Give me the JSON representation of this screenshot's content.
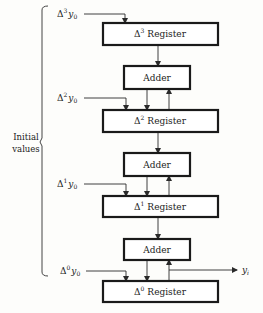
{
  "diagram": {
    "side_label": {
      "line1": "Initial",
      "line2": "values"
    },
    "inputs": [
      {
        "delta": "Δ",
        "power": "3",
        "var": "y",
        "sub": "0"
      },
      {
        "delta": "Δ",
        "power": "2",
        "var": "y",
        "sub": "0"
      },
      {
        "delta": "Δ",
        "power": "1",
        "var": "y",
        "sub": "0"
      },
      {
        "delta": "Δ",
        "power": "0",
        "var": "y",
        "sub": "0"
      }
    ],
    "registers": [
      {
        "delta": "Δ",
        "power": "3",
        "name": "Register"
      },
      {
        "delta": "Δ",
        "power": "2",
        "name": "Register"
      },
      {
        "delta": "Δ",
        "power": "1",
        "name": "Register"
      },
      {
        "delta": "Δ",
        "power": "0",
        "name": "Register"
      }
    ],
    "adders": [
      {
        "label": "Adder"
      },
      {
        "label": "Adder"
      },
      {
        "label": "Adder"
      }
    ],
    "output": {
      "var": "y",
      "sub": "i"
    }
  }
}
